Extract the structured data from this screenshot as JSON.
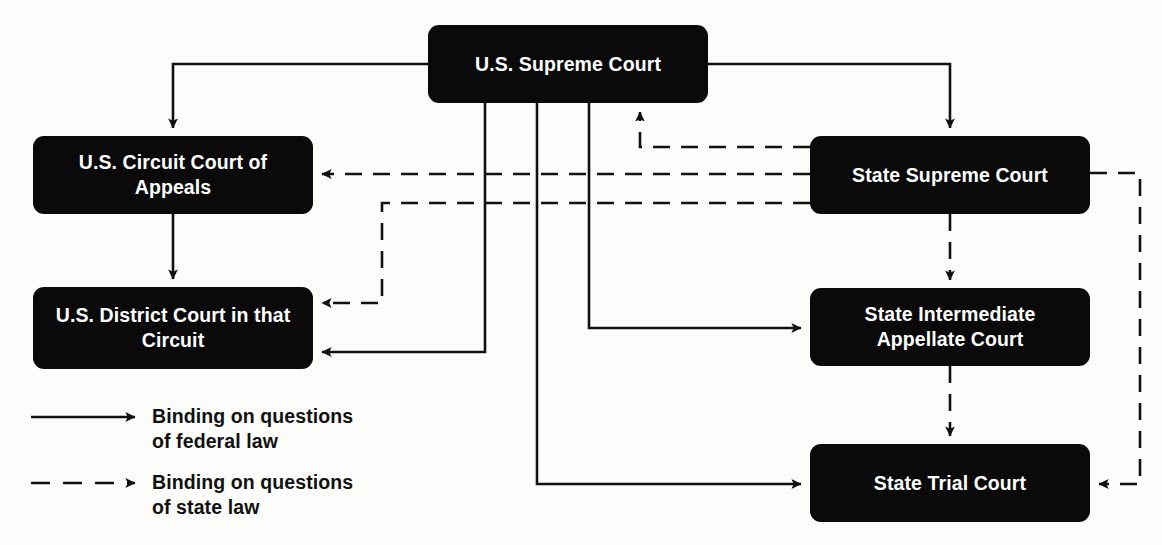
{
  "diagram": {
    "colors": {
      "node_fill": "#0a0a0a",
      "node_text": "#ffffff",
      "line": "#111111",
      "background": "#fcfcfa"
    },
    "nodes": [
      {
        "id": "us-supreme-court",
        "label": "U.S. Supreme\nCourt",
        "x": 428,
        "y": 25,
        "w": 280,
        "h": 78
      },
      {
        "id": "us-circuit-court-of-appeals",
        "label": "U.S. Circuit\nCourt of Appeals",
        "x": 33,
        "y": 136,
        "w": 280,
        "h": 78
      },
      {
        "id": "us-district-court",
        "label": "U.S. District Court\nin that Circuit",
        "x": 33,
        "y": 287,
        "w": 280,
        "h": 82
      },
      {
        "id": "state-supreme-court",
        "label": "State Supreme\nCourt",
        "x": 810,
        "y": 136,
        "w": 280,
        "h": 78
      },
      {
        "id": "state-intermediate-appellate-court",
        "label": "State Intermediate\nAppellate Court",
        "x": 810,
        "y": 288,
        "w": 280,
        "h": 78
      },
      {
        "id": "state-trial-court",
        "label": "State Trial Court",
        "x": 810,
        "y": 444,
        "w": 280,
        "h": 78
      }
    ],
    "edges": [
      {
        "id": "scotus-to-circuit",
        "style": "solid",
        "from": "us-supreme-court",
        "to": "us-circuit-court-of-appeals"
      },
      {
        "id": "scotus-to-state-supreme",
        "style": "solid",
        "from": "us-supreme-court",
        "to": "state-supreme-court"
      },
      {
        "id": "scotus-to-district",
        "style": "solid",
        "from": "us-supreme-court",
        "to": "us-district-court"
      },
      {
        "id": "scotus-to-state-trial",
        "style": "solid",
        "from": "us-supreme-court",
        "to": "state-trial-court"
      },
      {
        "id": "scotus-to-state-intermediate",
        "style": "solid",
        "from": "us-supreme-court",
        "to": "state-intermediate-appellate-court"
      },
      {
        "id": "circuit-to-district",
        "style": "solid",
        "from": "us-circuit-court-of-appeals",
        "to": "us-district-court"
      },
      {
        "id": "state-supreme-to-scotus",
        "style": "dashed",
        "from": "state-supreme-court",
        "to": "us-supreme-court"
      },
      {
        "id": "state-supreme-to-circuit",
        "style": "dashed",
        "from": "state-supreme-court",
        "to": "us-circuit-court-of-appeals"
      },
      {
        "id": "state-supreme-to-district",
        "style": "dashed",
        "from": "state-supreme-court",
        "to": "us-district-court"
      },
      {
        "id": "state-supreme-to-state-intermediate",
        "style": "dashed",
        "from": "state-supreme-court",
        "to": "state-intermediate-appellate-court"
      },
      {
        "id": "state-supreme-to-state-trial",
        "style": "dashed",
        "from": "state-supreme-court",
        "to": "state-trial-court"
      },
      {
        "id": "state-intermediate-to-state-trial",
        "style": "dashed",
        "from": "state-intermediate-appellate-court",
        "to": "state-trial-court"
      }
    ],
    "legend": {
      "items": [
        {
          "id": "legend-federal",
          "style": "solid",
          "label": "Binding on questions\nof federal law"
        },
        {
          "id": "legend-state",
          "style": "dashed",
          "label": "Binding on questions\nof state law"
        }
      ]
    }
  }
}
